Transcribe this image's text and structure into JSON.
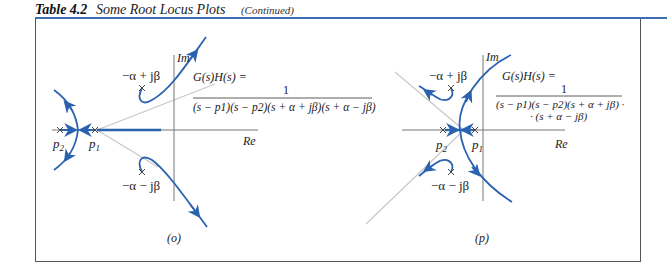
{
  "caption": {
    "table_number": "Table 4.2",
    "title": "Some Root Locus Plots",
    "continued": "(Continued)"
  },
  "colors": {
    "locus": "#2a62b0",
    "asymptote": "#c8c8c8",
    "axis": "#777777",
    "rule": "#3a6fb5",
    "frame": "#555555"
  },
  "panels": [
    {
      "label": "(o)",
      "axis_im": "Im",
      "axis_re": "Re",
      "pole_upper": "−α + jβ",
      "pole_lower": "−α − jβ",
      "pole_p1": "p1",
      "pole_p2": "p2",
      "tf_lhs": "G(s)H(s) =",
      "tf_num": "1",
      "tf_den_line1": "(s − p1)(s − p2)(s + α + jβ)(s + α − jβ)"
    },
    {
      "label": "(p)",
      "axis_im": "Im",
      "axis_re": "Re",
      "pole_upper": "−α + jβ",
      "pole_lower": "−α − jβ",
      "pole_p1": "p1",
      "pole_p2": "p2",
      "tf_lhs": "G(s)H(s) =",
      "tf_num": "1",
      "tf_den_line1": "(s − p1)(s − p2)(s + α + jβ) ·",
      "tf_den_line2": "· (s + α − jβ)"
    }
  ]
}
